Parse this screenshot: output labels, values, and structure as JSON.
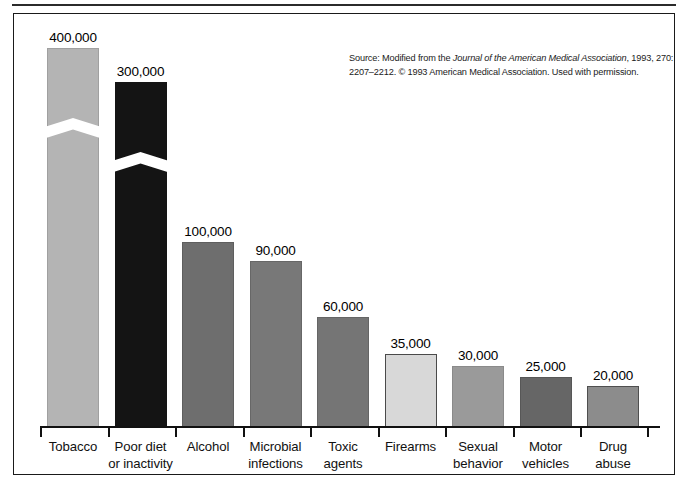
{
  "figure": {
    "source_note": {
      "prefix": "Source: Modified from the ",
      "journal": "Journal of the American Medical Association",
      "suffix": ", 1993, 270: 2207–2212. © 1993 American Medical Association. Used with permission."
    }
  },
  "chart_data": {
    "type": "bar",
    "title": "",
    "xlabel": "",
    "ylabel": "",
    "ylim": [
      0,
      400000
    ],
    "grid": false,
    "legend": null,
    "axis_break_note": "Tobacco and Poor diet or inactivity bars are drawn with a zig-zag axis break indicating a truncated scale",
    "categories": [
      "Tobacco",
      "Poor diet or inactivity",
      "Alcohol",
      "Microbial infections",
      "Toxic agents",
      "Firearms",
      "Sexual behavior",
      "Motor vehicles",
      "Drug abuse"
    ],
    "values": [
      400000,
      300000,
      100000,
      90000,
      60000,
      35000,
      30000,
      25000,
      20000
    ],
    "value_labels": [
      "400,000",
      "300,000",
      "100,000",
      "90,000",
      "60,000",
      "35,000",
      "30,000",
      "25,000",
      "20,000"
    ],
    "category_label_lines": [
      [
        "Tobacco",
        ""
      ],
      [
        "Poor diet",
        "or inactivity"
      ],
      [
        "Alcohol",
        ""
      ],
      [
        "Microbial",
        "infections"
      ],
      [
        "Toxic",
        "agents"
      ],
      [
        "Firearms",
        ""
      ],
      [
        "Sexual",
        "behavior"
      ],
      [
        "Motor",
        "vehicles"
      ],
      [
        "Drug",
        "abuse"
      ]
    ],
    "bar_colors": [
      "#b4b4b4",
      "#141414",
      "#6e6e6e",
      "#787878",
      "#757575",
      "#d8d8d8",
      "#9a9a9a",
      "#666666",
      "#8c8c8c"
    ],
    "bar_border_colors": [
      "#a0a0a0",
      "#141414",
      "#5e5e5e",
      "#676767",
      "#656565",
      "#4a4a4a",
      "#8a8a8a",
      "#575757",
      "#4f4f4f"
    ],
    "bar_pixel_heights": [
      379,
      345,
      185,
      166,
      110,
      73,
      61,
      50,
      41
    ],
    "has_break": [
      true,
      true,
      false,
      false,
      false,
      false,
      false,
      false,
      false
    ]
  }
}
